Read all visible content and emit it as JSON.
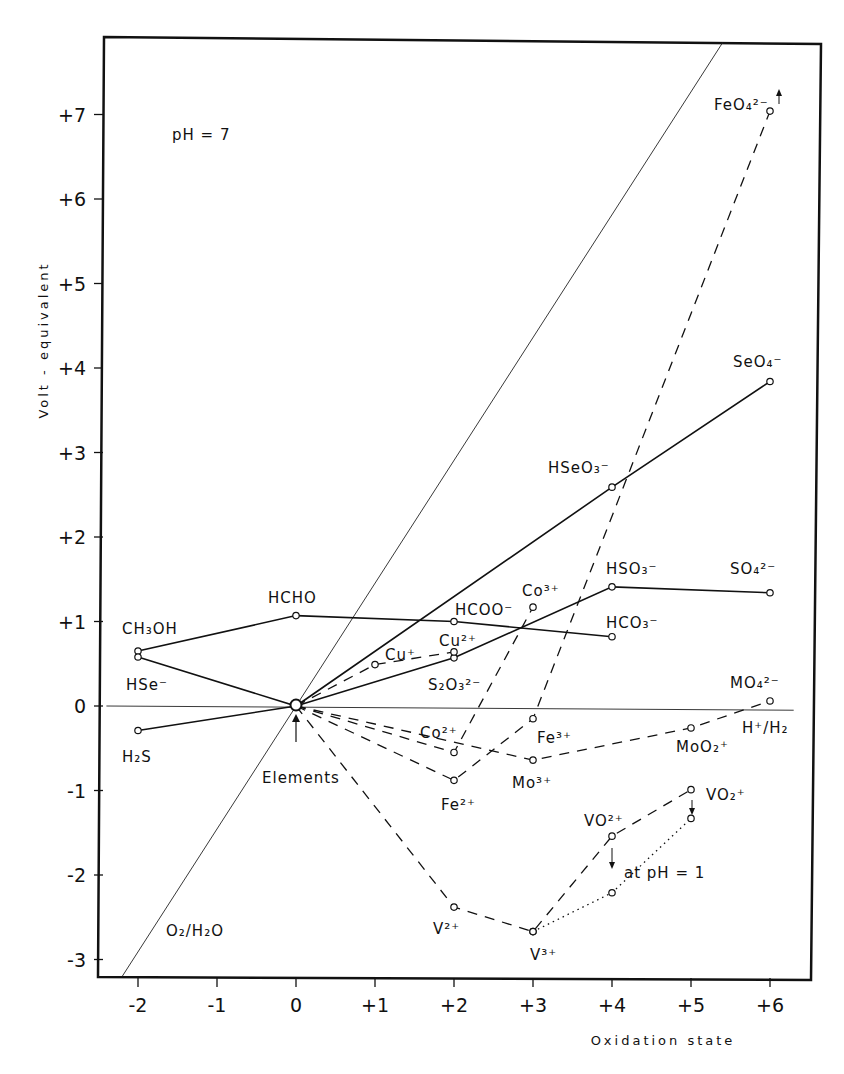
{
  "chart_data": {
    "type": "line",
    "title": "",
    "xlabel": "Oxidation state",
    "ylabel": "Volt - equivalent",
    "annotation_ph": "pH = 7",
    "annotation_ph1": "at pH = 1",
    "origin_label": "Elements",
    "xlim": [
      -2.5,
      6.5
    ],
    "ylim": [
      -3.3,
      7.9
    ],
    "x_ticks": [
      -2,
      -1,
      0,
      1,
      2,
      3,
      4,
      5,
      6
    ],
    "x_tick_labels": [
      "-2",
      "-1",
      "0",
      "+1",
      "+2",
      "+3",
      "+4",
      "+5",
      "+6"
    ],
    "y_ticks": [
      -3,
      -2,
      -1,
      0,
      1,
      2,
      3,
      4,
      5,
      6,
      7
    ],
    "y_tick_labels": [
      "-3",
      "-2",
      "-1",
      "0",
      "+1",
      "+2",
      "+3",
      "+4",
      "+5",
      "+6",
      "+7"
    ],
    "grid": false,
    "reference_lines": [
      {
        "name": "O2/H2O",
        "style": "thin",
        "points": [
          [
            -2.2,
            -3.2
          ],
          [
            5.4,
            7.85
          ]
        ]
      },
      {
        "name": "H+/H2",
        "style": "thin",
        "points": [
          [
            -2.4,
            0.0
          ],
          [
            6.3,
            -0.05
          ]
        ]
      }
    ],
    "series": [
      {
        "name": "Carbon",
        "style": "solid",
        "points": [
          {
            "x": -2,
            "y": 0.65,
            "label": "CH3OH"
          },
          {
            "x": 0,
            "y": 1.07,
            "label": "HCHO"
          },
          {
            "x": 2,
            "y": 1.0,
            "label": "HCOO-"
          },
          {
            "x": 4,
            "y": 0.82,
            "label": "HCO3-"
          }
        ]
      },
      {
        "name": "Selenium",
        "style": "solid",
        "points": [
          {
            "x": -2,
            "y": 0.58,
            "label": "HSe-"
          },
          {
            "x": 0,
            "y": 0.0,
            "label": "Elements"
          },
          {
            "x": 4,
            "y": 2.59,
            "label": "HSeO3-"
          },
          {
            "x": 6,
            "y": 3.84,
            "label": "SeO4-"
          }
        ]
      },
      {
        "name": "Sulfur",
        "style": "solid",
        "points": [
          {
            "x": -2,
            "y": -0.29,
            "label": "H2S"
          },
          {
            "x": 0,
            "y": 0.0,
            "label": "Elements"
          },
          {
            "x": 2,
            "y": 0.57,
            "label": "S2O3 2-"
          },
          {
            "x": 4,
            "y": 1.41,
            "label": "HSO3-"
          },
          {
            "x": 6,
            "y": 1.34,
            "label": "SO4 2-"
          }
        ]
      },
      {
        "name": "Copper",
        "style": "dashed",
        "points": [
          {
            "x": 0,
            "y": 0.0,
            "label": "Elements"
          },
          {
            "x": 1,
            "y": 0.49,
            "label": "Cu+"
          },
          {
            "x": 2,
            "y": 0.64,
            "label": "Cu2+"
          }
        ]
      },
      {
        "name": "Cobalt",
        "style": "dashed",
        "points": [
          {
            "x": 0,
            "y": 0.0,
            "label": "Elements"
          },
          {
            "x": 2,
            "y": -0.55,
            "label": "Co2+"
          },
          {
            "x": 3,
            "y": 1.17,
            "label": "Co3+"
          }
        ]
      },
      {
        "name": "Iron",
        "style": "dashed",
        "points": [
          {
            "x": 0,
            "y": 0.0,
            "label": "Elements"
          },
          {
            "x": 2,
            "y": -0.88,
            "label": "Fe2+"
          },
          {
            "x": 3,
            "y": -0.15,
            "label": "Fe3+"
          },
          {
            "x": 6,
            "y": 7.04,
            "label": "FeO4 2-"
          }
        ]
      },
      {
        "name": "Molybdenum",
        "style": "dashed",
        "points": [
          {
            "x": 0,
            "y": 0.0,
            "label": "Elements"
          },
          {
            "x": 3,
            "y": -0.64,
            "label": "Mo3+"
          },
          {
            "x": 5,
            "y": -0.26,
            "label": "MoO2+"
          },
          {
            "x": 6,
            "y": 0.06,
            "label": "MoO4 2-"
          }
        ]
      },
      {
        "name": "Vanadium (pH 7)",
        "style": "dashed",
        "points": [
          {
            "x": 0,
            "y": 0.0,
            "label": "Elements"
          },
          {
            "x": 2,
            "y": -2.38,
            "label": "V2+"
          },
          {
            "x": 3,
            "y": -2.67,
            "label": "V3+"
          },
          {
            "x": 4,
            "y": -1.54,
            "label": "VO2+"
          },
          {
            "x": 5,
            "y": -0.99,
            "label": "VO2+"
          }
        ]
      },
      {
        "name": "Vanadium (pH 1)",
        "style": "dotted",
        "points": [
          {
            "x": 3,
            "y": -2.67,
            "label": "V3+"
          },
          {
            "x": 4,
            "y": -2.21,
            "label": "VO2+ (pH 1)"
          },
          {
            "x": 5,
            "y": -1.33,
            "label": "VO2+ (pH 1)"
          }
        ]
      }
    ]
  },
  "labels": {
    "ch3oh": "CH₃OH",
    "hse": "HSe⁻",
    "h2s": "H₂S",
    "hcho": "HCHO",
    "hcoo": "HCOO⁻",
    "hco3": "HCO₃⁻",
    "cu1": "Cu⁺",
    "cu2": "Cu²⁺",
    "s2o3": "S₂O₃²⁻",
    "co2": "Co²⁺",
    "co3": "Co³⁺",
    "fe2": "Fe²⁺",
    "fe3": "Fe³⁺",
    "feo4": "FeO₄²⁻",
    "mo3": "Mo³⁺",
    "moo2": "MoO₂⁺",
    "moo4": "MO₄²⁻",
    "hso3": "HSO₃⁻",
    "so4": "SO₄²⁻",
    "hseo3": "HSeO₃⁻",
    "seo4": "SeO₄⁻",
    "v2": "V²⁺",
    "v3": "V³⁺",
    "vo2p": "VO²⁺",
    "vo2plus": "VO₂⁺",
    "h_h2": "H⁺/H₂",
    "o2_h2o": "O₂/H₂O"
  }
}
